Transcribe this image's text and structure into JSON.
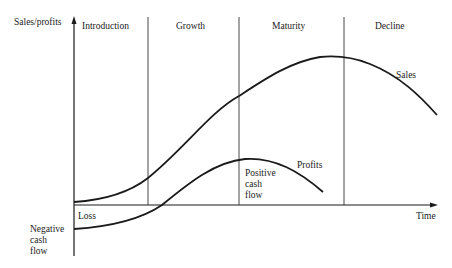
{
  "diagram": {
    "y_axis_label": "Sales/profits",
    "x_axis_label": "Time",
    "stages": [
      {
        "label": "Introduction"
      },
      {
        "label": "Growth"
      },
      {
        "label": "Maturity"
      },
      {
        "label": "Decline"
      }
    ],
    "curves": [
      {
        "name": "Sales",
        "label": "Sales"
      },
      {
        "name": "Profits",
        "label": "Profits"
      }
    ],
    "annotations": {
      "loss": "Loss",
      "negative_cash_flow": "Negative\ncash\nflow",
      "positive_cash_flow": "Positive\ncash\nflow"
    },
    "colors": {
      "line": "#1a1a1a",
      "divider": "#333333",
      "background": "#ffffff"
    }
  }
}
